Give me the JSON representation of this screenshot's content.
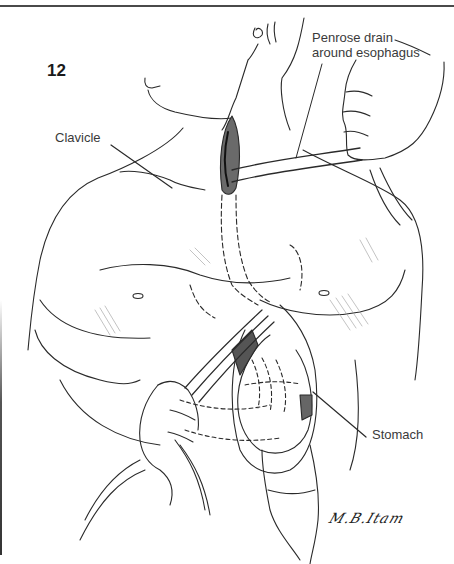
{
  "figure": {
    "number": "12",
    "labels": {
      "penrose": "Penrose drain around esophagus",
      "clavicle": "Clavicle",
      "stomach": "Stomach"
    },
    "signature": "M.B.Itam",
    "colors": {
      "line": "#2a2a2a",
      "label_text": "#3a3a3a",
      "rule": "#4a4a4a",
      "shading": "#9a9a9a",
      "background": "#ffffff"
    }
  }
}
